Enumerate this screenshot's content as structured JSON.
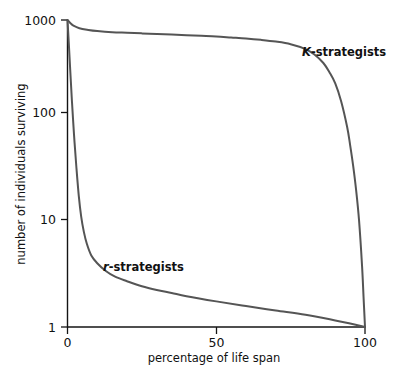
{
  "chart_data": {
    "type": "line",
    "title": "",
    "xlabel": "percentage of life span",
    "ylabel": "number of individuals surviving",
    "xlim": [
      0,
      100
    ],
    "ylim": [
      1,
      1000
    ],
    "yscale": "log",
    "grid": false,
    "legend_position": "inline-annotation",
    "xticks": [
      "0",
      "50",
      "100"
    ],
    "xtick_values": [
      0,
      50,
      100
    ],
    "yticks": [
      "1000",
      "100",
      "10",
      "1"
    ],
    "ytick_values": [
      1000,
      100,
      10,
      1
    ],
    "series": [
      {
        "name": "K-strategists",
        "name_italic_prefix": "K",
        "name_rest": "-strategists",
        "color": "#555555",
        "x": [
          0,
          1,
          2,
          4,
          7,
          10,
          15,
          20,
          25,
          30,
          35,
          40,
          45,
          50,
          55,
          60,
          65,
          70,
          75,
          80,
          83,
          86,
          88,
          90,
          92,
          94,
          95,
          96,
          97,
          98,
          99,
          99.5,
          100
        ],
        "values": [
          1000,
          930,
          880,
          830,
          800,
          780,
          760,
          750,
          740,
          730,
          720,
          710,
          700,
          690,
          675,
          660,
          640,
          615,
          580,
          520,
          460,
          380,
          310,
          240,
          160,
          90,
          60,
          38,
          22,
          11,
          4,
          2,
          1
        ]
      },
      {
        "name": "r-strategists",
        "name_italic_prefix": "r",
        "name_rest": "-strategists",
        "color": "#555555",
        "x": [
          0,
          0.4,
          0.9,
          1.5,
          2.2,
          3,
          3.8,
          4.6,
          5.5,
          6.5,
          8,
          10,
          13,
          16,
          20,
          25,
          30,
          35,
          40,
          50,
          60,
          70,
          80,
          90,
          95,
          100
        ],
        "values": [
          1000,
          620,
          330,
          160,
          75,
          36,
          19,
          12,
          8.5,
          6.5,
          5.0,
          4.2,
          3.5,
          3.1,
          2.8,
          2.5,
          2.3,
          2.15,
          2.0,
          1.78,
          1.6,
          1.45,
          1.32,
          1.16,
          1.08,
          1
        ]
      }
    ],
    "annotations": [
      {
        "text": "K-strategists",
        "x_pct": 79,
        "y_px": 52
      },
      {
        "text": "r-strategists",
        "x_pct": 26,
        "y_px": 267
      }
    ]
  },
  "labels": {
    "y_axis_title": "number of individuals surviving",
    "x_axis_title": "percentage of life span",
    "y_tick_1000": "1000",
    "y_tick_100": "100",
    "y_tick_10": "10",
    "y_tick_1": "1",
    "x_tick_0": "0",
    "x_tick_50": "50",
    "x_tick_100": "100",
    "k_label_italic": "K",
    "k_label_rest": "-strategists",
    "r_label_italic": "r",
    "r_label_rest": "-strategists"
  },
  "colors": {
    "background": "#ffffff",
    "curve": "#555555",
    "axis": "#141414",
    "text": "#111111"
  }
}
